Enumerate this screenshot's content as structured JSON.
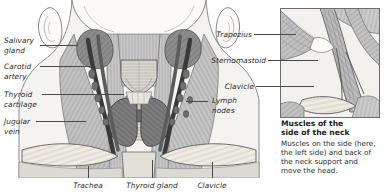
{
  "figure": {
    "title_visible": false,
    "background_color": "#ffffff",
    "ink_color": "#2b2b2b",
    "leader_color": "#4a4a4a"
  },
  "main_illustration": {
    "name": "anterior-neck-anatomy",
    "description": "Front view of the neck showing salivary glands, carotid arteries, jugular veins, thyroid cartilage, thyroid gland, trachea, lymph nodes and clavicles"
  },
  "inset_illustration": {
    "name": "lateral-neck-muscles",
    "description": "Close-up of the left side of the neck showing trapezius, sternomastoid and clavicle"
  },
  "labels_left": [
    {
      "id": "salivary-gland",
      "text": "Salivary\ngland"
    },
    {
      "id": "carotid-artery",
      "text": "Carotid\nartery"
    },
    {
      "id": "thyroid-cartilage",
      "text": "Thyroid\ncartilage"
    },
    {
      "id": "jugular-vein",
      "text": "Jugular\nvein"
    }
  ],
  "labels_right": [
    {
      "id": "trapezius",
      "text": "Trapezius"
    },
    {
      "id": "sternomastoid",
      "text": "Sternomastoid"
    },
    {
      "id": "clavicle-inset",
      "text": "Clavicle"
    },
    {
      "id": "lymph-nodes",
      "text": "Lymph\nnodes"
    }
  ],
  "labels_bottom": [
    {
      "id": "trachea",
      "text": "Trachea"
    },
    {
      "id": "thyroid-gland",
      "text": "Thyroid gland"
    },
    {
      "id": "clavicle",
      "text": "Clavicle"
    }
  ],
  "caption": {
    "heading": "Muscles of the\nside of the neck",
    "body": "Muscles on the side (here,\nthe left side) and back of\nthe neck support and\nmove the head."
  }
}
